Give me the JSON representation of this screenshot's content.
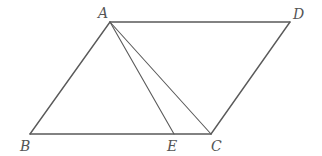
{
  "figure": {
    "type": "parallelogram",
    "stroke_color": "#5a5a5a",
    "label_color": "#555555",
    "points": {
      "A": {
        "x": 110,
        "y": 22,
        "label": "A",
        "label_x": 98,
        "label_y": 6
      },
      "D": {
        "x": 290,
        "y": 22,
        "label": "D",
        "label_x": 293,
        "label_y": 7
      },
      "B": {
        "x": 30,
        "y": 134,
        "label": "B",
        "label_x": 20,
        "label_y": 139
      },
      "C": {
        "x": 211,
        "y": 134,
        "label": "C",
        "label_x": 211,
        "label_y": 139
      },
      "E": {
        "x": 174,
        "y": 134,
        "label": "E",
        "label_x": 167,
        "label_y": 139
      }
    },
    "segments": [
      {
        "from": "A",
        "to": "D"
      },
      {
        "from": "D",
        "to": "C"
      },
      {
        "from": "C",
        "to": "B"
      },
      {
        "from": "B",
        "to": "A"
      },
      {
        "from": "A",
        "to": "E"
      },
      {
        "from": "A",
        "to": "C"
      }
    ]
  }
}
